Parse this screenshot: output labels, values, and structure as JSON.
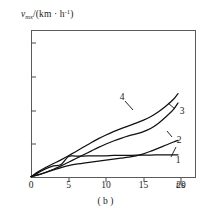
{
  "chart_data": {
    "type": "line",
    "title": "",
    "caption": "( b )",
    "ylabel": {
      "var": "v",
      "sub": "mx",
      "unit_open": "/(km · h",
      "unit_sup": "-1",
      "unit_close": ")",
      "full": "v_mx/(km · h^-1)"
    },
    "xlabel": "t/s",
    "xlabel_var": "t",
    "xlabel_unit": "/s",
    "xlim": [
      0,
      22
    ],
    "ylim": [
      0,
      44
    ],
    "xticks": [
      0,
      5,
      10,
      15,
      20
    ],
    "yticks": [
      10,
      20,
      30,
      40
    ],
    "grid": false,
    "legend": "inline-end-labels",
    "x": [
      0,
      1,
      2,
      3,
      4,
      5,
      6,
      7,
      8,
      9,
      10,
      11,
      12,
      13,
      14,
      15,
      16,
      17,
      18,
      19,
      19.6
    ],
    "series": [
      {
        "name": "1",
        "label": "1",
        "values": [
          0.4,
          1.6,
          2.8,
          3.6,
          4.0,
          6.4,
          6.5,
          6.5,
          6.6,
          6.6,
          6.6,
          6.7,
          6.7,
          6.7,
          6.8,
          6.8,
          6.8,
          6.9,
          6.9,
          6.9,
          6.9
        ]
      },
      {
        "name": "2",
        "label": "2",
        "values": [
          0.4,
          1.0,
          1.7,
          2.4,
          3.1,
          3.7,
          4.1,
          4.4,
          4.7,
          5.0,
          5.3,
          5.6,
          5.9,
          6.2,
          6.6,
          7.2,
          8.0,
          8.9,
          9.8,
          10.7,
          11.2
        ]
      },
      {
        "name": "3",
        "label": "3",
        "values": [
          0.4,
          0.9,
          1.7,
          2.6,
          3.6,
          4.7,
          5.8,
          6.9,
          8.0,
          9.1,
          10.1,
          11.0,
          11.8,
          12.5,
          13.1,
          13.8,
          14.8,
          16.3,
          18.2,
          20.4,
          22.3
        ]
      },
      {
        "name": "4",
        "label": "4",
        "values": [
          0.4,
          1.9,
          3.2,
          4.3,
          5.4,
          6.6,
          7.9,
          9.2,
          10.5,
          11.7,
          12.8,
          13.8,
          14.7,
          15.5,
          16.3,
          17.2,
          18.3,
          19.7,
          21.4,
          23.4,
          25.1
        ]
      }
    ],
    "series_label_positions": [
      {
        "name": "1",
        "x_px": 178,
        "y_px": 160,
        "leader": [
          171,
          157,
          176,
          147
        ]
      },
      {
        "name": "2",
        "x_px": 179,
        "y_px": 140,
        "leader": [
          172,
          137,
          167,
          131
        ]
      },
      {
        "name": "3",
        "x_px": 182,
        "y_px": 111,
        "leader": [
          175,
          109,
          168,
          103
        ]
      },
      {
        "name": "4",
        "x_px": 122,
        "y_px": 97,
        "leader": [
          125,
          101,
          133,
          110
        ]
      }
    ],
    "colors": {
      "curve": "#111111",
      "axis": "#5a5a5a",
      "text": "#1a1a1a",
      "background": "#ffffff"
    }
  }
}
